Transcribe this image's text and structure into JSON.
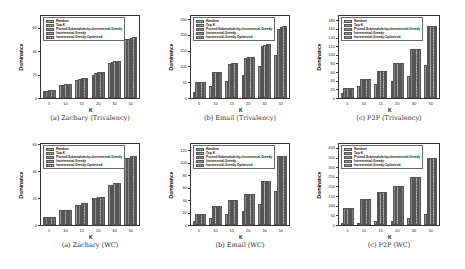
{
  "legend": [
    "Random",
    "Top-K",
    "Pruned-Submodularity+Incremental-Greedy",
    "Incremental-Greedy",
    "Incremental-Greedy-Optimized"
  ],
  "chart_data": [
    {
      "type": "bar",
      "title": "(a) Zachary (Trivalency)",
      "xlabel": "K",
      "ylabel": "Dominance",
      "categories": [
        "5",
        "10",
        "15",
        "20",
        "30",
        "50"
      ],
      "ylim": [
        0,
        70
      ],
      "yticks": [
        "0",
        "20",
        "40",
        "60"
      ],
      "ytick_values": [
        0,
        20,
        40,
        60
      ],
      "series": [
        {
          "name": "Random",
          "values": [
            6,
            11,
            15,
            20,
            30,
            50
          ]
        },
        {
          "name": "Top-K",
          "values": [
            6,
            11,
            16,
            21,
            31,
            50
          ]
        },
        {
          "name": "Pruned-Submodularity+Incremental-Greedy",
          "values": [
            7,
            12,
            17,
            22,
            32,
            51
          ]
        },
        {
          "name": "Incremental-Greedy",
          "values": [
            7,
            12,
            17,
            22,
            32,
            52
          ]
        },
        {
          "name": "Incremental-Greedy-Optimized",
          "values": [
            7,
            12,
            17,
            22,
            32,
            52
          ]
        }
      ]
    },
    {
      "type": "bar",
      "title": "(b) Email (Trivalency)",
      "xlabel": "K",
      "ylabel": "Dominance",
      "categories": [
        "5",
        "10",
        "15",
        "20",
        "30",
        "50"
      ],
      "ylim": [
        0,
        260
      ],
      "yticks": [
        "0",
        "50",
        "100",
        "150",
        "200",
        "250"
      ],
      "ytick_values": [
        0,
        50,
        100,
        150,
        200,
        250
      ],
      "series": [
        {
          "name": "Random",
          "values": [
            18,
            37,
            55,
            72,
            100,
            135
          ]
        },
        {
          "name": "Top-K",
          "values": [
            50,
            82,
            108,
            128,
            165,
            220
          ]
        },
        {
          "name": "Pruned-Submodularity+Incremental-Greedy",
          "values": [
            50,
            83,
            110,
            130,
            168,
            225
          ]
        },
        {
          "name": "Incremental-Greedy",
          "values": [
            50,
            83,
            110,
            130,
            170,
            228
          ]
        },
        {
          "name": "Incremental-Greedy-Optimized",
          "values": [
            50,
            83,
            110,
            130,
            170,
            228
          ]
        }
      ]
    },
    {
      "type": "bar",
      "title": "(c) P2P (Trivalency)",
      "xlabel": "K",
      "ylabel": "Dominance",
      "categories": [
        "5",
        "10",
        "15",
        "20",
        "30",
        "50"
      ],
      "ylim": [
        0,
        190
      ],
      "yticks": [
        "0",
        "20",
        "40",
        "60",
        "80",
        "100",
        "120",
        "140",
        "160",
        "180"
      ],
      "ytick_values": [
        0,
        20,
        40,
        60,
        80,
        100,
        120,
        140,
        160,
        180
      ],
      "series": [
        {
          "name": "Random",
          "values": [
            12,
            27,
            33,
            40,
            51,
            76
          ]
        },
        {
          "name": "Top-K",
          "values": [
            24,
            45,
            63,
            81,
            113,
            166
          ]
        },
        {
          "name": "Pruned-Submodularity+Incremental-Greedy",
          "values": [
            24,
            45,
            63,
            81,
            113,
            167
          ]
        },
        {
          "name": "Incremental-Greedy",
          "values": [
            24,
            45,
            63,
            81,
            113,
            167
          ]
        },
        {
          "name": "Incremental-Greedy-Optimized",
          "values": [
            24,
            45,
            63,
            81,
            113,
            167
          ]
        }
      ]
    },
    {
      "type": "bar",
      "title": "(a) Zachary (WC)",
      "xlabel": "K",
      "ylabel": "Dominance",
      "categories": [
        "5",
        "10",
        "15",
        "20",
        "30",
        "50"
      ],
      "ylim": [
        0,
        60
      ],
      "yticks": [
        "0",
        "20",
        "40",
        "60"
      ],
      "ytick_values": [
        0,
        20,
        40,
        60
      ],
      "series": [
        {
          "name": "Random",
          "values": [
            6,
            11,
            15,
            20,
            30,
            50
          ]
        },
        {
          "name": "Top-K",
          "values": [
            6,
            11,
            15,
            20,
            30,
            50
          ]
        },
        {
          "name": "Pruned-Submodularity+Incremental-Greedy",
          "values": [
            6,
            11,
            16,
            21,
            31,
            51
          ]
        },
        {
          "name": "Incremental-Greedy",
          "values": [
            6,
            11,
            16,
            21,
            31,
            51
          ]
        },
        {
          "name": "Incremental-Greedy-Optimized",
          "values": [
            6,
            11,
            16,
            21,
            31,
            51
          ]
        }
      ]
    },
    {
      "type": "bar",
      "title": "(b) Email (WC)",
      "xlabel": "K",
      "ylabel": "Dominance",
      "categories": [
        "5",
        "10",
        "15",
        "20",
        "30",
        "50"
      ],
      "ylim": [
        0,
        130
      ],
      "yticks": [
        "0",
        "20",
        "40",
        "60",
        "80",
        "100",
        "120"
      ],
      "ytick_values": [
        0,
        20,
        40,
        60,
        80,
        100,
        120
      ],
      "series": [
        {
          "name": "Random",
          "values": [
            6,
            12,
            17,
            22,
            33,
            54
          ]
        },
        {
          "name": "Top-K",
          "values": [
            17,
            30,
            40,
            50,
            70,
            110
          ]
        },
        {
          "name": "Pruned-Submodularity+Incremental-Greedy",
          "values": [
            17,
            30,
            40,
            50,
            70,
            110
          ]
        },
        {
          "name": "Incremental-Greedy",
          "values": [
            17,
            30,
            40,
            50,
            70,
            110
          ]
        },
        {
          "name": "Incremental-Greedy-Optimized",
          "values": [
            17,
            30,
            40,
            50,
            70,
            110
          ]
        }
      ]
    },
    {
      "type": "bar",
      "title": "(c) P2P (WC)",
      "xlabel": "K",
      "ylabel": "Dominance",
      "categories": [
        "5",
        "10",
        "15",
        "20",
        "30",
        "50"
      ],
      "ylim": [
        0,
        420
      ],
      "yticks": [
        "0",
        "50",
        "100",
        "150",
        "200",
        "250",
        "300",
        "350",
        "400"
      ],
      "ytick_values": [
        0,
        50,
        100,
        150,
        200,
        250,
        300,
        350,
        400
      ],
      "series": [
        {
          "name": "Random",
          "values": [
            8,
            12,
            20,
            22,
            35,
            57
          ]
        },
        {
          "name": "Top-K",
          "values": [
            90,
            137,
            170,
            200,
            250,
            348
          ]
        },
        {
          "name": "Pruned-Submodularity+Incremental-Greedy",
          "values": [
            90,
            137,
            170,
            200,
            250,
            348
          ]
        },
        {
          "name": "Incremental-Greedy",
          "values": [
            90,
            137,
            170,
            200,
            250,
            348
          ]
        },
        {
          "name": "Incremental-Greedy-Optimized",
          "values": [
            90,
            137,
            170,
            200,
            250,
            348
          ]
        }
      ]
    }
  ]
}
